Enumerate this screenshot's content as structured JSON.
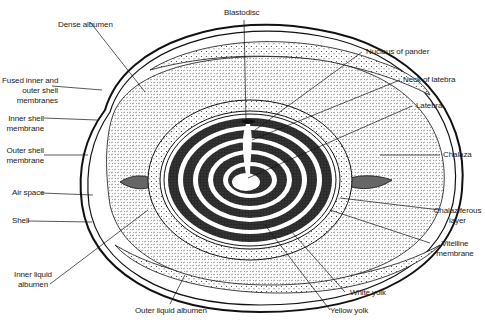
{
  "diagram": {
    "colors": {
      "ink": "#1a1a1a",
      "background": "#ffffff",
      "dense_texture": "#d9d9d9",
      "yolk_dark": "#2a2a2a"
    },
    "labels": {
      "dense_albumen": "Dense albumen",
      "blastodisc": "Blastodisc",
      "nucleus_of_pander": "Nucleus of pander",
      "neck_of_latebra": "Neck of latebra",
      "latebra": "Latebra",
      "fused_membranes": "Fused inner and\nouter shell\nmembranes",
      "inner_shell_membrane": "Inner shell\nmembrane",
      "outer_shell_membrane": "Outer shell\nmembrane",
      "chalaza": "Chalaza",
      "air_space": "Air space",
      "shell": "Shell",
      "chalaziferous_layer": "Chalaziferous\nlayer",
      "vitelline_membrane": "Vitelline\nmembrane",
      "inner_liquid_albumen": "Inner liquid\nalbumen",
      "outer_liquid_albumen": "Outer liquid albumen",
      "white_yolk": "White yolk",
      "yellow_yolk": "Yellow yolk"
    }
  }
}
